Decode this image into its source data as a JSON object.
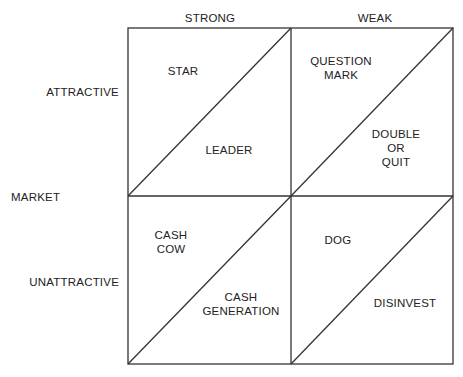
{
  "diagram": {
    "type": "matrix-2x2-split",
    "column_headers": [
      "STRONG",
      "WEAK"
    ],
    "row_headers": [
      "ATTRACTIVE",
      "UNATTRACTIVE"
    ],
    "row_axis_label": "MARKET",
    "cells": {
      "attractive_strong": {
        "upper": "STAR",
        "lower": "LEADER"
      },
      "attractive_weak": {
        "upper": [
          "QUESTION",
          "MARK"
        ],
        "lower": [
          "DOUBLE",
          "OR",
          "QUIT"
        ]
      },
      "unattractive_strong": {
        "upper": [
          "CASH",
          "COW"
        ],
        "lower": [
          "CASH",
          "GENERATION"
        ]
      },
      "unattractive_weak": {
        "upper": "DOG",
        "lower": "DISINVEST"
      }
    },
    "line_color": "#333333"
  }
}
